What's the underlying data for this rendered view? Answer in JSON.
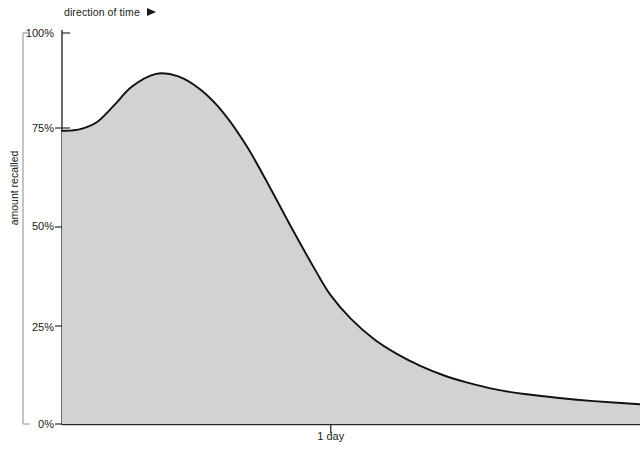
{
  "chart_data": {
    "type": "area",
    "title": "",
    "subtitle": "",
    "xlabel": "direction of time",
    "ylabel": "amount recalled",
    "x_tick_labels": [
      "1 day"
    ],
    "x_tick_positions_fraction": [
      0.465
    ],
    "y_tick_labels": [
      "100%",
      "75%",
      "50%",
      "25%",
      "0%"
    ],
    "y_tick_values": [
      100,
      75,
      50,
      25,
      0
    ],
    "ylim": [
      0,
      100
    ],
    "grid": false,
    "legend": null,
    "annotations": [
      {
        "text": "direction of time",
        "icon": "arrow-right-icon"
      }
    ],
    "curve_description": "Forgetting curve: starts at 75% recall, rises to a peak of about 90%, then decays steeply past the 1 day mark down to a low asymptote near 5%.",
    "series": [
      {
        "name": "amount recalled",
        "fill_color": "#d2d2d2",
        "line_color": "#111111",
        "x": [
          0.0,
          0.03,
          0.06,
          0.09,
          0.12,
          0.161,
          0.2,
          0.24,
          0.28,
          0.32,
          0.36,
          0.4,
          0.44,
          0.465,
          0.5,
          0.54,
          0.58,
          0.62,
          0.66,
          0.7,
          0.75,
          0.8,
          0.86,
          0.92,
          1.0
        ],
        "y": [
          75.0,
          75.4,
          77.2,
          81.5,
          86.2,
          89.5,
          89.0,
          85.5,
          79.5,
          71.0,
          60.5,
          49.5,
          39.0,
          33.0,
          27.0,
          21.8,
          18.0,
          15.0,
          12.6,
          10.8,
          9.0,
          7.8,
          6.8,
          6.0,
          5.2
        ]
      }
    ]
  },
  "axes": {
    "y_title": "amount recalled",
    "y_ticks": [
      {
        "label": "100%",
        "value": 100
      },
      {
        "label": "75%",
        "value": 75
      },
      {
        "label": "50%",
        "value": 50
      },
      {
        "label": "25%",
        "value": 25
      },
      {
        "label": "0%",
        "value": 0
      }
    ],
    "x_ticks": [
      {
        "label": "1 day",
        "value": 0.465
      }
    ]
  },
  "caption": {
    "direction_of_time": "direction of time",
    "arrow_icon": "arrow-right-icon"
  },
  "colors": {
    "area_fill": "#d2d2d2",
    "curve_stroke": "#111111",
    "axis_stroke": "#2b2b2b",
    "bracket_stroke": "#8a8a8a",
    "background": "#ffffff",
    "text": "#1a1a1a"
  }
}
